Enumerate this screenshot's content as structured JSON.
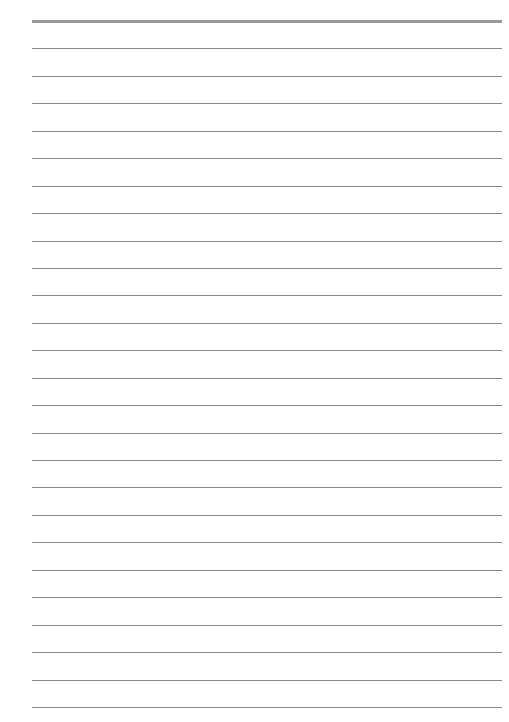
{
  "page": {
    "type": "lined-paper",
    "background_color": "#ffffff",
    "rule_color": "#8a8a8a",
    "header_rule_color": "#9a9a9a",
    "line_count": 26,
    "first_line_y": 21,
    "line_spacing": 27.44,
    "line_left": 32,
    "line_width": 470,
    "text": ""
  }
}
